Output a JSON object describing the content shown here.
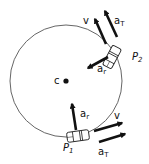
{
  "diagram": {
    "type": "circular-motion-vectors",
    "circle": {
      "cx": 66,
      "cy": 81,
      "r": 56,
      "stroke": "#555555"
    },
    "center": {
      "label": "c",
      "x": 66,
      "y": 81
    },
    "colors": {
      "arrow": "#111111",
      "car_fill": "#ffffff",
      "car_stroke": "#222222"
    },
    "points": [
      {
        "name": "P1",
        "label_main": "P",
        "label_sub": "1",
        "vectors": [
          {
            "label_main": "a",
            "label_sub": "r",
            "kind": "radial acceleration"
          },
          {
            "label_main": "v",
            "label_sub": "",
            "kind": "velocity"
          },
          {
            "label_main": "a",
            "label_sub": "T",
            "kind": "tangential acceleration"
          }
        ]
      },
      {
        "name": "P2",
        "label_main": "P",
        "label_sub": "2",
        "vectors": [
          {
            "label_main": "a",
            "label_sub": "r",
            "kind": "radial acceleration"
          },
          {
            "label_main": "v",
            "label_sub": "",
            "kind": "velocity"
          },
          {
            "label_main": "a",
            "label_sub": "T",
            "kind": "tangential acceleration"
          }
        ]
      }
    ]
  }
}
